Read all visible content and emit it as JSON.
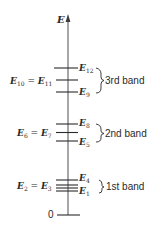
{
  "diagram": {
    "axis_label": "E",
    "zero_label": "0",
    "colors": {
      "ink": "#2a2a2a",
      "background": "#ffffff"
    },
    "bands": [
      {
        "name": "3rd band",
        "levels": [
          {
            "label": "E",
            "sub": "12",
            "side": "right",
            "y": 68
          },
          {
            "label": "E",
            "sub": "10 = E",
            "sub2": "11",
            "side": "left",
            "y": 80
          },
          {
            "label": "E",
            "sub": "9",
            "side": "right",
            "y": 92
          }
        ],
        "brace": {
          "top": 68,
          "bottom": 93
        }
      },
      {
        "name": "2nd band",
        "levels": [
          {
            "label": "E",
            "sub": "8",
            "side": "right",
            "y": 124
          },
          {
            "label": "E",
            "sub": "6 = E",
            "sub2": "7",
            "side": "left",
            "y": 132
          },
          {
            "label": "E",
            "sub": "5",
            "side": "right",
            "y": 141
          }
        ],
        "brace": {
          "top": 124,
          "bottom": 142
        }
      },
      {
        "name": "1st band",
        "levels": [
          {
            "label": "E",
            "sub": "4",
            "side": "right",
            "y": 180
          },
          {
            "label": "E",
            "sub": "2 = E",
            "sub2": "3",
            "side": "left",
            "y": 185
          },
          {
            "label": "",
            "sub": "",
            "side": "none",
            "y": 188
          },
          {
            "label": "E",
            "sub": "1",
            "side": "right",
            "y": 191
          }
        ],
        "brace": {
          "top": 180,
          "bottom": 193
        }
      }
    ]
  }
}
